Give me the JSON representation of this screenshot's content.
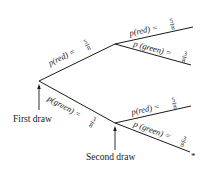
{
  "diagram": {
    "type": "probability-tree",
    "stages": {
      "first": "First draw",
      "second": "Second draw"
    },
    "first_draw": {
      "red": {
        "label": "p(red) =",
        "num": "5",
        "den": "8"
      },
      "green": {
        "label": "p(green) =",
        "num": "3",
        "den": "8"
      }
    },
    "second_draw_after_red": {
      "red": {
        "label": "p(red) =",
        "num": "5",
        "den": "8"
      },
      "green": {
        "label": "p (green) =",
        "num": "3",
        "den": "8"
      }
    },
    "second_draw_after_green": {
      "red": {
        "label": "p(red) =",
        "num": "5",
        "den": "8"
      },
      "green": {
        "label": "p (green) =",
        "num": "3",
        "den": "8"
      }
    },
    "marker": "*",
    "colors": {
      "ink": "#1a1a1a",
      "background": "#ffffff"
    }
  }
}
